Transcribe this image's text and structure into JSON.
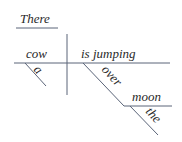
{
  "diagram": {
    "type": "sentence-diagram",
    "words": {
      "expletive": "There",
      "subject": "cow",
      "subject_modifier": "a",
      "predicate": "is jumping",
      "preposition": "over",
      "object_of_preposition": "moon",
      "object_modifier": "the"
    },
    "colors": {
      "line": "#5a6478",
      "text": "#2a2a2a",
      "background": "#ffffff"
    }
  }
}
